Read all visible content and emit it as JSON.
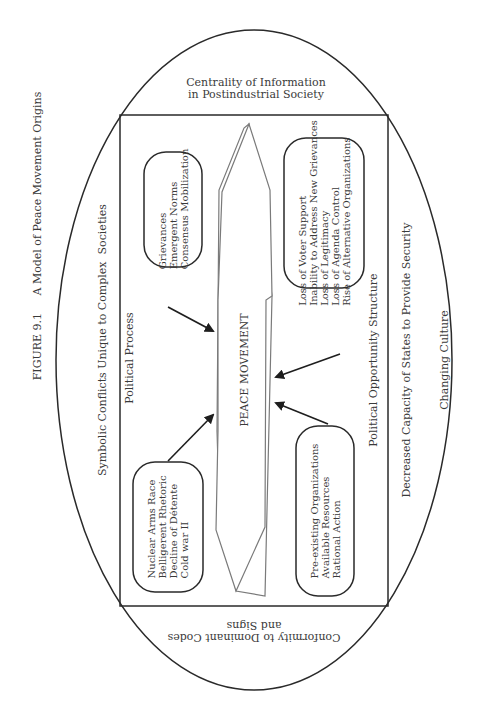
{
  "figure": {
    "caption": "FIGURE 9.1     A Model of Peace Movement Origins"
  },
  "outer_ellipse": {
    "top_label": "Centrality of Information\nin Postindustrial Society",
    "bottom_label_upside_down": "Conformity to Dominant Codes\nand Signs",
    "left_label": "Symbolic Conflicts Unique to Complex  Societies",
    "right_label": "Decreased Capacity of States to Provide Security",
    "far_right_label": "Changing Culture"
  },
  "inner_box": {
    "left_label": "Political Process",
    "right_label": "Political Opportunity Structure"
  },
  "center": {
    "label": "PEACE MOVEMENT"
  },
  "boxes": {
    "top_left": {
      "lines": "Grievances\nEmergent Norms\nConsensus Mobilization"
    },
    "bottom_left": {
      "lines": "Nuclear Arms Race\nBelligerent Rhetoric\nDecline of Détente\nCold war II"
    },
    "top_right": {
      "lines": "Loss of Voter Support\nInability to Address New Grievances\nLoss of Legitimacy\nLoss of Agenda Control\nRise of Alternative Organizations"
    },
    "bottom_right": {
      "lines": "Pre-existing Organizations\nAvailable Resources\nRational Action"
    }
  },
  "colors": {
    "line": "#2a2a2a",
    "polygon": "#7a7a7a",
    "text": "#3a3a3a",
    "background": "#ffffff"
  }
}
